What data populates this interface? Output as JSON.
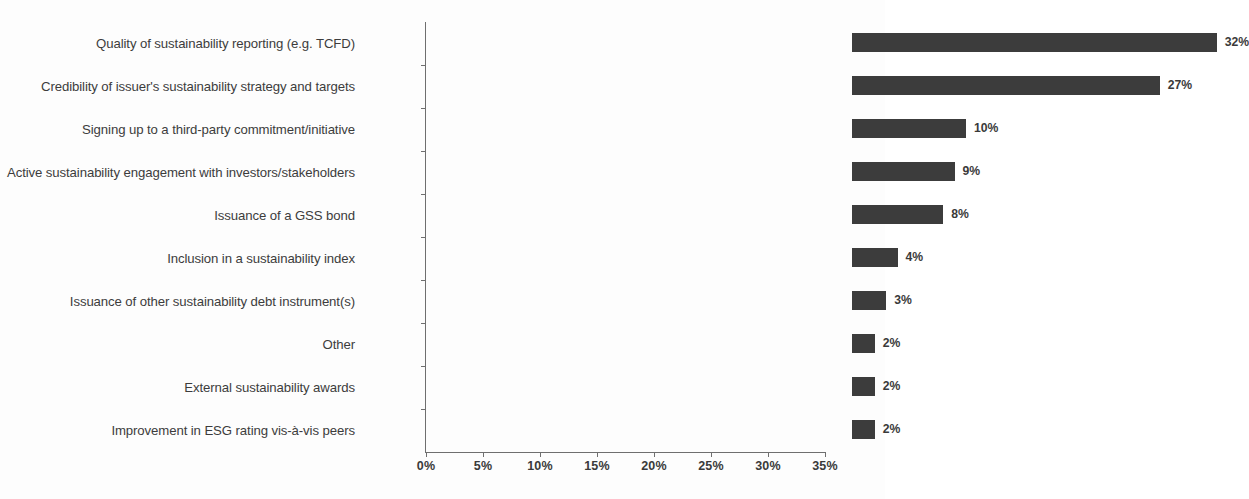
{
  "chart_data": {
    "type": "bar",
    "orientation": "horizontal",
    "title": "",
    "xlabel": "",
    "ylabel": "",
    "xlim": [
      0,
      35
    ],
    "xtick_step": 5,
    "grid": false,
    "legend": null,
    "bar_color": "#3c3c3c",
    "axis_color": "#6f6f6f",
    "value_suffix": "%",
    "xticks": [
      "0%",
      "5%",
      "10%",
      "15%",
      "20%",
      "25%",
      "30%",
      "35%"
    ],
    "xtick_values": [
      0,
      5,
      10,
      15,
      20,
      25,
      30,
      35
    ],
    "categories": [
      "Quality of sustainability reporting (e.g. TCFD)",
      "Credibility of issuer's sustainability strategy and targets",
      "Signing up to a third-party commitment/initiative",
      "Active sustainability engagement with investors/stakeholders",
      "Issuance of a GSS  bond",
      "Inclusion in a sustainability index",
      "Issuance of other sustainability debt instrument(s)",
      "Other",
      "External sustainability awards",
      "Improvement in ESG rating vis-à-vis peers"
    ],
    "values": [
      32,
      27,
      10,
      9,
      8,
      4,
      3,
      2,
      2,
      2
    ],
    "value_labels": [
      "32%",
      "27%",
      "10%",
      "9%",
      "8%",
      "4%",
      "3%",
      "2%",
      "2%",
      "2%"
    ]
  }
}
